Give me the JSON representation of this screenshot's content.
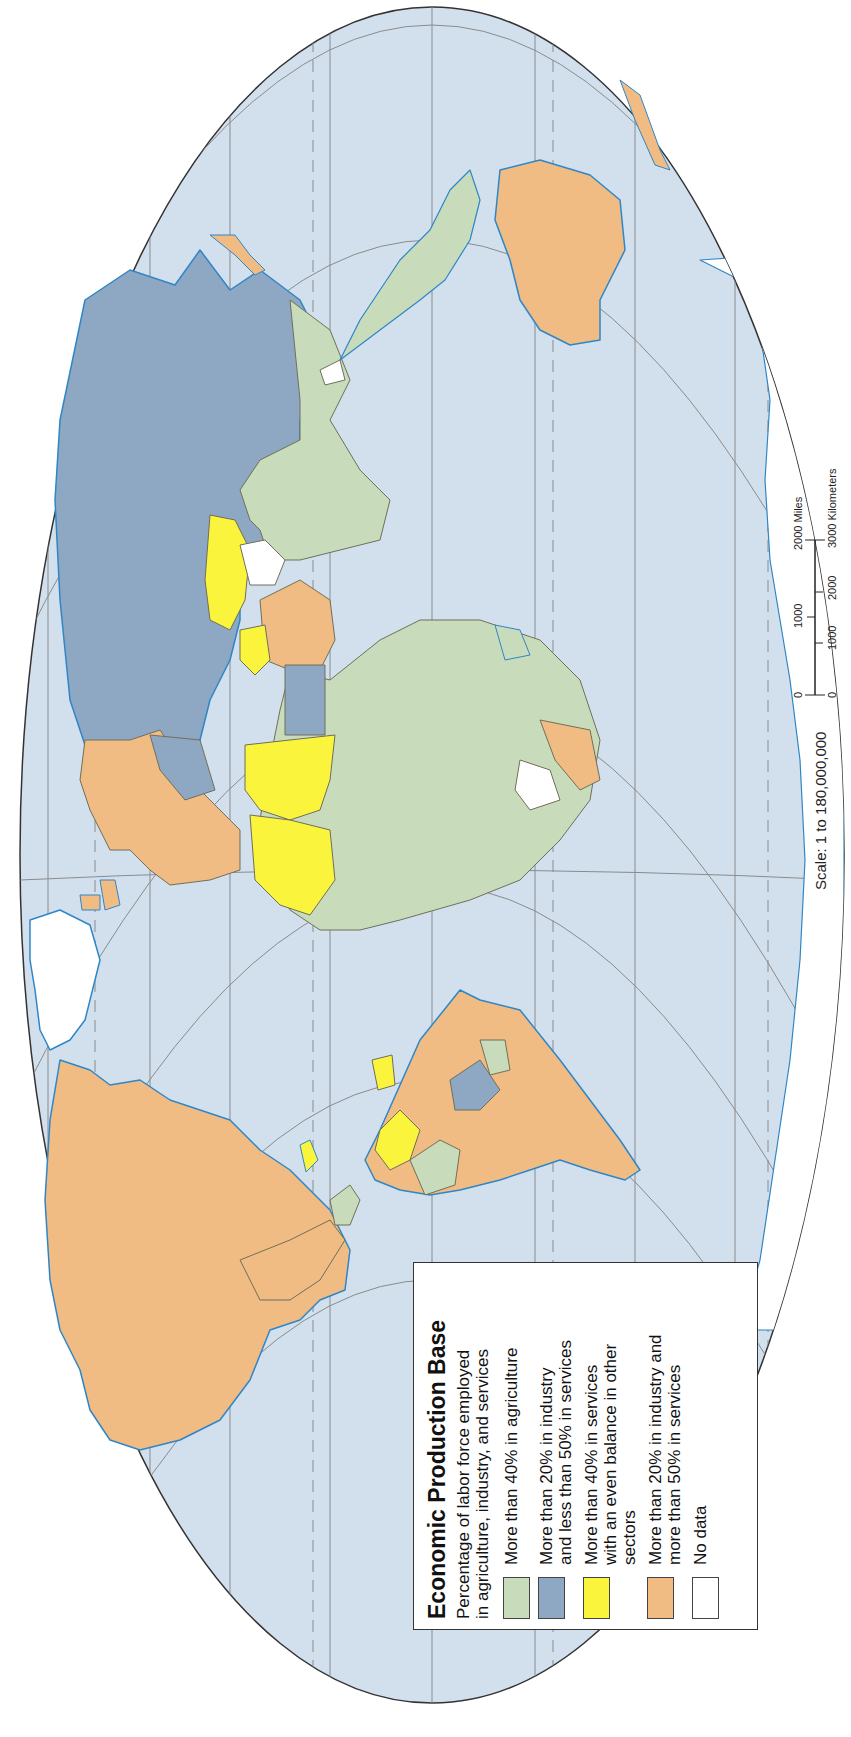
{
  "legend": {
    "title": "Economic Production Base",
    "subtitle": "Percentage of labor force employed\nin agriculture, industry, and services",
    "items": [
      {
        "label": "More than 40% in agriculture",
        "color": "#c8dcbc"
      },
      {
        "label": "More than 20% in industry\nand less than 50% in services",
        "color": "#8ea8c3"
      },
      {
        "label": "More than 40% in services\nwith an even balance in other\nsectors",
        "color": "#fbf43c"
      },
      {
        "label": "More than 20% in industry and\nmore than 50% in services",
        "color": "#f0bc84"
      },
      {
        "label": "No data",
        "color": "#ffffff"
      }
    ]
  },
  "scale": {
    "text": "Scale:  1 to 180,000,000",
    "miles_ticks": [
      "0",
      "1000",
      "2000 Miles"
    ],
    "km_ticks": [
      "0",
      "1000",
      "2000",
      "3000 Kilometers"
    ]
  },
  "colors": {
    "ocean": "#d2e0ee",
    "coast": "#2f86c6",
    "graticule": "#8a8a8a",
    "border": "#6f6f5a"
  },
  "orientation": "rotated 90 degrees counter-clockwise (north to the left)"
}
